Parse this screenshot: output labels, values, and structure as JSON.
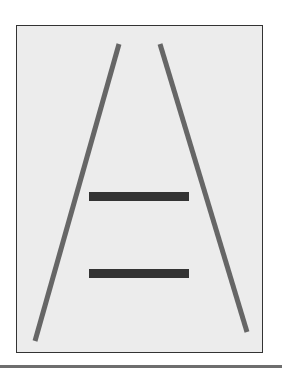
{
  "figure": {
    "title": "",
    "colors": {
      "background": "#ececec",
      "frame": "#333333",
      "converging_lines": "#666666",
      "bars": "#333333",
      "rule": "#6e6e6e"
    },
    "converging_lines": [
      {
        "x1": 119,
        "y1": 44,
        "x2": 35,
        "y2": 341
      },
      {
        "x1": 160,
        "y1": 44,
        "x2": 247,
        "y2": 332
      }
    ],
    "bars": [
      {
        "x": 89,
        "y": 192,
        "width": 100,
        "height": 9
      },
      {
        "x": 89,
        "y": 269,
        "width": 100,
        "height": 9
      }
    ]
  }
}
